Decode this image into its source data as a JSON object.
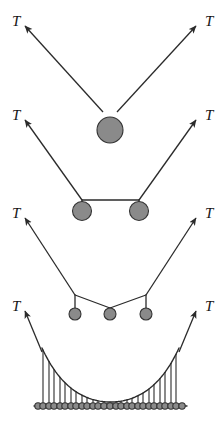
{
  "figure": {
    "background_color": "#ffffff",
    "width": 221,
    "height": 423,
    "stroke_color": "#2b2b2b",
    "mass_fill_color": "#8a8a8a",
    "mass_stroke_color": "#333333",
    "label_color": "#141414"
  },
  "labels": {
    "tension": "T"
  },
  "panels": [
    {
      "id": "panel-one-mass",
      "name": "single-mass-panel",
      "mass_count": 1,
      "mass_radius": 13,
      "left_label": {
        "text": "T",
        "x": 12,
        "y": 26
      },
      "right_label": {
        "text": "T",
        "x": 205,
        "y": 26
      },
      "left_arrow": {
        "x1": 103,
        "y1": 112,
        "x2": 25,
        "y2": 26
      },
      "right_arrow": {
        "x1": 117,
        "y1": 112,
        "x2": 196,
        "y2": 26
      },
      "masses": [
        {
          "cx": 110,
          "cy": 130,
          "r": 13
        }
      ],
      "apex": {
        "x": 110,
        "y": 117
      }
    },
    {
      "id": "panel-two-masses",
      "name": "two-mass-panel",
      "mass_count": 2,
      "mass_radius": 9.5,
      "left_label": {
        "text": "T",
        "x": 12,
        "y": 120
      },
      "right_label": {
        "text": "T",
        "x": 205,
        "y": 120
      },
      "left_arrow": {
        "x1": 82,
        "y1": 200,
        "x2": 25,
        "y2": 120
      },
      "right_arrow": {
        "x1": 139,
        "y1": 200,
        "x2": 196,
        "y2": 120
      },
      "bar": {
        "x1": 82,
        "y1": 200,
        "x2": 139,
        "y2": 200
      },
      "masses": [
        {
          "cx": 82,
          "cy": 211,
          "r": 9.5
        },
        {
          "cx": 139,
          "cy": 211,
          "r": 9.5
        }
      ]
    },
    {
      "id": "panel-three-masses",
      "name": "three-mass-panel",
      "mass_count": 3,
      "mass_radius": 6,
      "left_label": {
        "text": "T",
        "x": 12,
        "y": 218
      },
      "right_label": {
        "text": "T",
        "x": 205,
        "y": 218
      },
      "left_arrow": {
        "x1": 75,
        "y1": 295,
        "x2": 25,
        "y2": 218
      },
      "right_arrow": {
        "x1": 146,
        "y1": 295,
        "x2": 196,
        "y2": 218
      },
      "chain": [
        {
          "x": 75,
          "y": 295
        },
        {
          "x": 110,
          "y": 308
        },
        {
          "x": 146,
          "y": 295
        }
      ],
      "masses": [
        {
          "cx": 75,
          "cy": 314,
          "r": 6
        },
        {
          "cx": 110,
          "cy": 314,
          "r": 6
        },
        {
          "cx": 146,
          "cy": 314,
          "r": 6
        }
      ]
    },
    {
      "id": "panel-catenary",
      "name": "catenary-panel",
      "mass_count": 27,
      "mass_radius": 3.2,
      "left_label": {
        "text": "T",
        "x": 12,
        "y": 311
      },
      "right_label": {
        "text": "T",
        "x": 205,
        "y": 311
      },
      "left_arrow": {
        "x1": 42,
        "y1": 352,
        "x2": 25,
        "y2": 311
      },
      "right_arrow": {
        "x1": 179,
        "y1": 352,
        "x2": 196,
        "y2": 311
      },
      "baseline_y": 406,
      "curve_left_x": 42,
      "curve_right_x": 179,
      "curve_top_y": 348,
      "curve_bottom_y": 402
    }
  ],
  "chart_data": {
    "type": "line",
    "xlabel": "",
    "ylabel": "",
    "series": [
      {
        "name": "one mass",
        "x": [
          25,
          110,
          196
        ],
        "y": [
          26,
          117,
          26
        ],
        "mass_positions": [
          110
        ],
        "mass_radius": 13
      },
      {
        "name": "two masses",
        "x": [
          25,
          82,
          139,
          196
        ],
        "y": [
          120,
          200,
          200,
          120
        ],
        "mass_positions": [
          82,
          139
        ],
        "mass_radius": 9.5
      },
      {
        "name": "three masses",
        "x": [
          25,
          75,
          110,
          146,
          196
        ],
        "y": [
          218,
          295,
          308,
          295,
          218
        ],
        "mass_positions": [
          75,
          110,
          146
        ],
        "mass_radius": 6
      },
      {
        "name": "continuous catenary",
        "x": [
          42,
          56,
          70,
          83,
          97,
          110,
          124,
          138,
          151,
          165,
          179
        ],
        "y": [
          348,
          372,
          388,
          397,
          401,
          402,
          401,
          397,
          388,
          372,
          348
        ],
        "mass_positions": [
          38,
          43,
          49,
          54,
          60,
          65,
          71,
          76,
          82,
          87,
          93,
          98,
          104,
          110,
          116,
          121,
          127,
          132,
          138,
          143,
          149,
          154,
          160,
          165,
          171,
          176,
          182
        ],
        "mass_radius": 3.2
      }
    ],
    "legend": [],
    "grid": false
  }
}
